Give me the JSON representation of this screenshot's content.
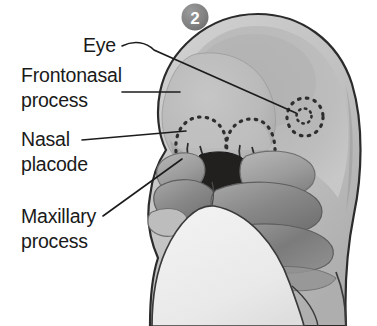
{
  "figure": {
    "badge": {
      "name": "stage-number-badge",
      "value": "2",
      "fill_color": "#878787",
      "text_color": "#ffffff"
    },
    "background_color": "#ffffff"
  },
  "labels": [
    {
      "id": "eye",
      "lines": [
        "Eye"
      ],
      "align": "right",
      "text_x": 116,
      "text_y": 52,
      "line_height": 25
    },
    {
      "id": "frontonasal-process",
      "lines": [
        "Frontonasal",
        "process"
      ],
      "align": "left",
      "text_x": 21,
      "text_y": 82,
      "line_height": 25
    },
    {
      "id": "nasal-placode",
      "lines": [
        "Nasal",
        "placode"
      ],
      "align": "left",
      "text_x": 21,
      "text_y": 146,
      "line_height": 25
    },
    {
      "id": "maxillary-process",
      "lines": [
        "Maxillary",
        "process"
      ],
      "align": "left",
      "text_x": 21,
      "text_y": 223,
      "line_height": 25
    }
  ],
  "leader_lines": [
    {
      "id": "eye-leader",
      "path": "M 122 46 C 134 40 146 42 154 50 L 296 113"
    },
    {
      "id": "frontonasal-leader",
      "path": "M 122 92 L 180 92"
    },
    {
      "id": "nasal-placode-leader",
      "path": "M 82 140 L 186 131"
    },
    {
      "id": "maxillary-leader",
      "path": "M 103 216 L 182 159"
    }
  ],
  "anatomy": {
    "head_outline_color": "#2b2b2b",
    "regions": [
      {
        "id": "head-dorsal",
        "name": "head-dorsal-region",
        "color": "#c4c4c4"
      },
      {
        "id": "head-highlight",
        "name": "head-highlight-region",
        "color": "#adadad"
      },
      {
        "id": "frontonasal-prominence",
        "name": "frontonasal-prominence",
        "color": "#bcbcbc"
      },
      {
        "id": "maxillary-process-left",
        "name": "maxillary-process",
        "color": "#9a9a9a"
      },
      {
        "id": "mandibular-arch",
        "name": "mandibular-arch",
        "color": "#8a8a8a"
      },
      {
        "id": "second-pharyngeal-arch",
        "name": "second-pharyngeal-arch",
        "color": "#7d7d7d"
      },
      {
        "id": "stomodeum",
        "name": "stomodeum-oral-opening",
        "color": "#221f1f"
      },
      {
        "id": "heart-bulge",
        "name": "heart-bulge-body",
        "color": "#ececec"
      },
      {
        "id": "eye-placode",
        "name": "eye-optic-vesicle",
        "color": "#b5b5b5"
      },
      {
        "id": "nasal-placode-left",
        "name": "nasal-placode-left",
        "color": "#bdbdbd"
      },
      {
        "id": "nasal-placode-right",
        "name": "nasal-placode-right",
        "color": "#bdbdbd"
      }
    ],
    "dotted_marker_color": "#2e2e2e"
  }
}
